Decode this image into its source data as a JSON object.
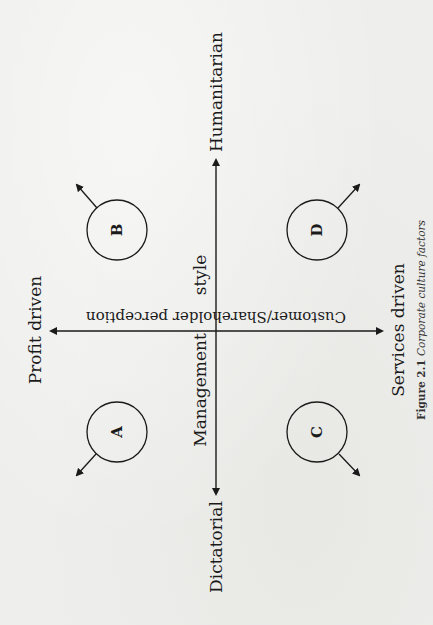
{
  "figure": {
    "number": "Figure 2.1",
    "title": "Corporate culture factors"
  },
  "axes": {
    "vertical": {
      "name": "Management style",
      "name_part1": "Management",
      "name_part2": "style",
      "top_end": "Humanitarian",
      "bottom_end": "Dictatorial"
    },
    "horizontal": {
      "name": "Customer/Shareholder perception",
      "left_end": "Profit driven",
      "right_end": "Services driven"
    }
  },
  "quadrants": [
    {
      "id": "A",
      "label": "A",
      "position": "lower-left",
      "arrow_direction": "down-left"
    },
    {
      "id": "B",
      "label": "B",
      "position": "upper-left",
      "arrow_direction": "up-left"
    },
    {
      "id": "C",
      "label": "C",
      "position": "lower-right",
      "arrow_direction": "down-right"
    },
    {
      "id": "D",
      "label": "D",
      "position": "upper-right",
      "arrow_direction": "up-right"
    }
  ],
  "colors": {
    "paper": "#eeeeec",
    "ink": "#1a1a1a"
  }
}
